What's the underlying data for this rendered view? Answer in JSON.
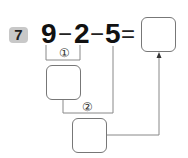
{
  "problem": {
    "number": "7",
    "expression": {
      "a": "9",
      "op1": "−",
      "b": "2",
      "op2": "−",
      "c": "5",
      "eq": "="
    },
    "step_labels": [
      "①",
      "②"
    ],
    "answer_box": "",
    "step1_box": "",
    "step2_box": ""
  },
  "colors": {
    "badge_bg": "#c8c8c8",
    "line": "#888888",
    "text": "#111111"
  }
}
